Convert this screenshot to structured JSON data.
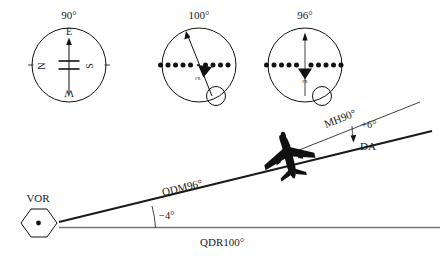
{
  "instruments": [
    {
      "id": "compass-1",
      "heading_label": "90°",
      "cardinals": {
        "top": "E",
        "left": "N",
        "right": "S",
        "bottom": "W"
      },
      "needle": "vertical",
      "has_cdi_dots": false,
      "has_obs_knob": false,
      "flag_label": ""
    },
    {
      "id": "compass-2",
      "heading_label": "100°",
      "cardinals": {
        "top": "",
        "left": "",
        "right": "",
        "bottom": ""
      },
      "needle": "deflected",
      "has_cdi_dots": true,
      "cdi_dots_left": 5,
      "cdi_dots_right": 5,
      "has_obs_knob": true,
      "flag_label": "FR"
    },
    {
      "id": "compass-3",
      "heading_label": "96°",
      "cardinals": {
        "top": "",
        "left": "",
        "right": "",
        "bottom": ""
      },
      "needle": "centered",
      "has_cdi_dots": true,
      "cdi_dots_left": 5,
      "cdi_dots_right": 5,
      "has_obs_knob": true,
      "flag_label": "FR"
    }
  ],
  "station": {
    "label": "VOR",
    "symbol": "hexagon-with-dot"
  },
  "tracks": {
    "qdm_label": "QDM96°",
    "qdr_label": "QDR100°",
    "heading_label": "MH90°"
  },
  "angles": {
    "station_angle": "−4°",
    "drift_angle_value": "+6°",
    "drift_angle_label": "DA"
  },
  "aircraft": {
    "symbol": "airplane-silhouette"
  },
  "colors": {
    "ink": "#111111",
    "grey_line": "#767676",
    "background": "#ffffff"
  }
}
